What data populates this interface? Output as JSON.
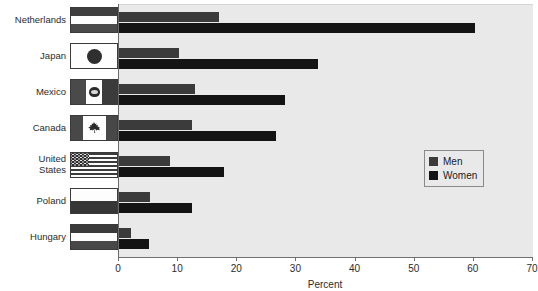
{
  "chart_data": {
    "type": "bar",
    "orientation": "horizontal",
    "title": "",
    "xlabel": "Percent",
    "ylabel": "",
    "xlim": [
      0,
      70
    ],
    "xticks": [
      0,
      10,
      20,
      30,
      40,
      50,
      60,
      70
    ],
    "xtick_labels": [
      "0",
      "10",
      "20",
      "30",
      "40",
      "50",
      "60",
      "70"
    ],
    "grid": false,
    "legend_position": "right-middle",
    "categories": [
      "Netherlands",
      "Japan",
      "Mexico",
      "Canada",
      "United\nStates",
      "Poland",
      "Hungary"
    ],
    "series": [
      {
        "name": "Men",
        "color": "#3b3b3b",
        "values": [
          16.9,
          10.2,
          12.9,
          12.4,
          8.7,
          5.2,
          2.1
        ]
      },
      {
        "name": "Women",
        "color": "#141414",
        "values": [
          60.2,
          33.6,
          28.1,
          26.5,
          17.8,
          12.4,
          5.0
        ]
      }
    ]
  },
  "axis": {
    "title": "Percent"
  },
  "legend": {
    "entries": [
      {
        "label": "Men",
        "color": "#3b3b3b"
      },
      {
        "label": "Women",
        "color": "#141414"
      }
    ]
  },
  "categories_meta": [
    {
      "label": "Netherlands",
      "flag": "netherlands-flag"
    },
    {
      "label": "Japan",
      "flag": "japan-flag"
    },
    {
      "label": "Mexico",
      "flag": "mexico-flag"
    },
    {
      "label": "Canada",
      "flag": "canada-flag"
    },
    {
      "label": "United\nStates",
      "flag": "united-states-flag"
    },
    {
      "label": "Poland",
      "flag": "poland-flag"
    },
    {
      "label": "Hungary",
      "flag": "hungary-flag"
    }
  ],
  "colors": {
    "plot_background": "#e9e9e9",
    "page_background": "#ffffff",
    "axis": "#6f6f6f",
    "men": "#3b3b3b",
    "women": "#141414"
  }
}
